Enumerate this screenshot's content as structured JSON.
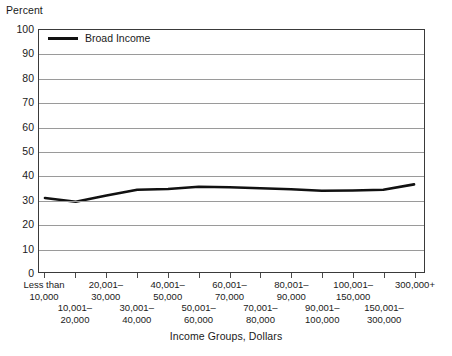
{
  "chart_data": {
    "type": "line",
    "title": "",
    "ylabel": "Percent",
    "xlabel": "Income Groups, Dollars",
    "ylim": [
      0,
      100
    ],
    "yticks": [
      0,
      10,
      20,
      30,
      40,
      50,
      60,
      70,
      80,
      90,
      100
    ],
    "grid": true,
    "legend_position": "top-left",
    "categories": [
      "Less than 10,000",
      "10,001–20,000",
      "20,001–30,000",
      "30,001–40,000",
      "40,001–50,000",
      "50,001–60,000",
      "60,001–70,000",
      "70,001–80,000",
      "80,001–90,000",
      "90,001–100,000",
      "100,001–150,000",
      "150,001–300,000",
      "300,000+"
    ],
    "series": [
      {
        "name": "Broad Income",
        "color": "#111111",
        "values": [
          30.6,
          29.0,
          31.6,
          34.0,
          34.3,
          35.2,
          35.0,
          34.6,
          34.2,
          33.6,
          33.7,
          34.0,
          36.2
        ]
      }
    ]
  },
  "axes": {
    "y_title": "Percent",
    "x_title": "Income Groups, Dollars",
    "y_tick_labels": [
      "100",
      "90",
      "80",
      "70",
      "60",
      "50",
      "40",
      "30",
      "20",
      "10",
      "0"
    ]
  },
  "legend": {
    "entries": [
      {
        "label": "Broad Income",
        "color": "#111111"
      }
    ]
  },
  "x_tick_labels": [
    {
      "line1": "Less than",
      "line2": "10,000",
      "row": "upper"
    },
    {
      "line1": "10,001–",
      "line2": "20,000",
      "row": "lower"
    },
    {
      "line1": "20,001–",
      "line2": "30,000",
      "row": "upper"
    },
    {
      "line1": "30,001–",
      "line2": "40,000",
      "row": "lower"
    },
    {
      "line1": "40,001–",
      "line2": "50,000",
      "row": "upper"
    },
    {
      "line1": "50,001–",
      "line2": "60,000",
      "row": "lower"
    },
    {
      "line1": "60,001–",
      "line2": "70,000",
      "row": "upper"
    },
    {
      "line1": "70,001–",
      "line2": "80,000",
      "row": "lower"
    },
    {
      "line1": "80,001–",
      "line2": "90,000",
      "row": "upper"
    },
    {
      "line1": "90,001–",
      "line2": "100,000",
      "row": "lower"
    },
    {
      "line1": "100,001–",
      "line2": "150,000",
      "row": "upper"
    },
    {
      "line1": "150,001–",
      "line2": "300,000",
      "row": "lower"
    },
    {
      "line1": "300,000+",
      "line2": "",
      "row": "upper"
    }
  ],
  "colors": {
    "line": "#111111",
    "grid": "#9a9a9a",
    "frame": "#3a3a3a",
    "text": "#1a1a1a",
    "background": "#ffffff"
  }
}
